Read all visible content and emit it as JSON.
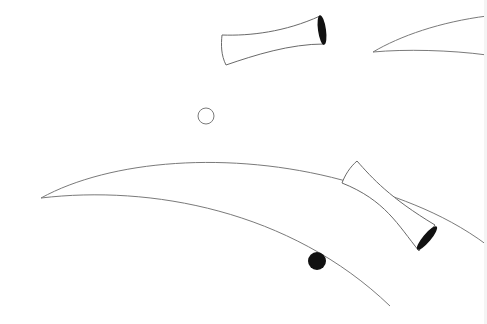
{
  "canvas": {
    "width": 487,
    "height": 324,
    "background": "#ffffff"
  },
  "colors": {
    "stroke": "#7a7a7a",
    "fill_dark": "#111111",
    "bone_fill": "#ffffff"
  },
  "shapes": {
    "bone_top": {
      "left_end": [
        221,
        34,
        221,
        65
      ],
      "right_end": [
        318,
        15,
        326,
        45
      ]
    },
    "bone_right": {
      "top_end": [
        342,
        183,
        358,
        161
      ],
      "bottom_end": [
        418,
        252,
        436,
        225
      ]
    },
    "hollow_circle": {
      "cx": 206,
      "cy": 116,
      "r": 8
    },
    "filled_circle": {
      "cx": 317,
      "cy": 261,
      "r": 9
    },
    "curve_top_right": {
      "tip": [
        373,
        52
      ]
    },
    "curve_left": {
      "tip": [
        41,
        198
      ]
    }
  }
}
